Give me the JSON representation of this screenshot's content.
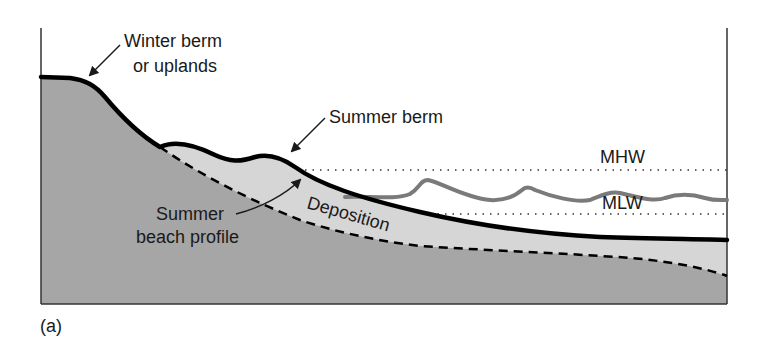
{
  "figure": {
    "panel_label": "(a)",
    "colors": {
      "background": "#ffffff",
      "upland_fill": "#a6a6a6",
      "deposition_fill": "#d6d6d6",
      "profile_line": "#000000",
      "wave_line": "#7a7a7a",
      "frame": "#333333",
      "text": "#1a1a1a"
    }
  },
  "labels": {
    "winter_berm_line1": "Winter berm",
    "winter_berm_line2": "or uplands",
    "summer_berm": "Summer berm",
    "summer_beach_line1": "Summer",
    "summer_beach_line2": "beach profile",
    "deposition": "Deposition",
    "mhw": "MHW",
    "mlw": "MLW"
  }
}
